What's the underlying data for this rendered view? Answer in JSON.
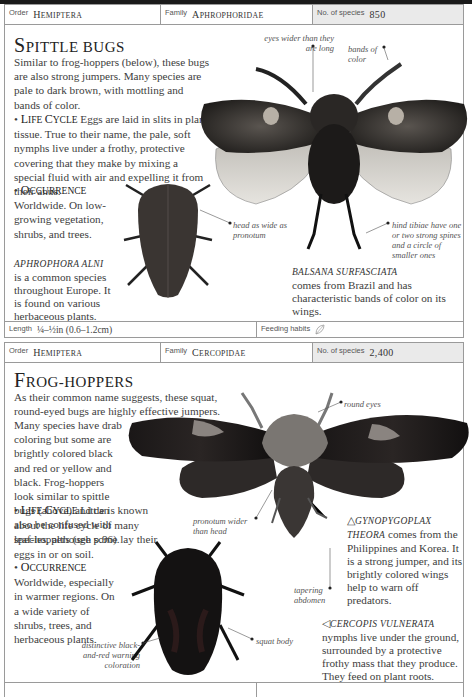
{
  "top": {
    "order_label": "Order",
    "order_value": "Hemiptera",
    "family_label": "Family",
    "family_value": "Aphrophoridae",
    "species_label": "No. of species",
    "species_value": "850"
  },
  "spittle": {
    "title_first": "S",
    "title_rest": "PITTLE BUGS",
    "intro": "Similar to frog-hoppers (below), these bugs are also strong jumpers. Many species are pale to dark brown, with mottling and bands of color.",
    "life_cycle_head_a": "L",
    "life_cycle_head_b": "IFE ",
    "life_cycle_head_c": "C",
    "life_cycle_head_d": "YCLE",
    "life_cycle_text": "Eggs are laid in slits in plant tissue. True to their name, the pale, soft nymphs live under a frothy, protective covering that they make by mixing a special fluid with air and expelling it from their anus.",
    "occurrence_head_a": "O",
    "occurrence_head_b": "CCURRENCE",
    "occurrence_text": "Worldwide. On low-growing vegetation, shrubs, and trees.",
    "species1_name": "APHROPHORA ALNI",
    "species1_text": "is a common species throughout Europe. It is found on various herbaceous plants.",
    "species2_name": "BALSANA SURFASCIATA",
    "species2_text": "comes from Brazil and has characteristic bands of color on its wings.",
    "annotations": {
      "eyes": "eyes wider than they are long",
      "bands": "bands of color",
      "head": "head as wide as pronotum",
      "tibiae": "hind tibiae have one or two strong spines and a circle of smaller ones"
    },
    "length_label": "Length",
    "length_value": "¼–½in (0.6–1.2cm)",
    "feeding_label": "Feeding habits",
    "feeding_icon": "leaf-icon"
  },
  "mid": {
    "order_label": "Order",
    "order_value": "Hemiptera",
    "family_label": "Family",
    "family_value": "Cercopidae",
    "species_label": "No. of species",
    "species_value": "2,400"
  },
  "frog": {
    "title_first": "F",
    "title_rest": "ROG-HOPPERS",
    "intro_wide": "As their common name suggests, these squat, round-eyed bugs are highly effective jumpers.",
    "intro_narrow": "Many species have drab coloring but some are brightly colored black and red or yellow and black. Frog-hoppers look similar to spittle bugs (above) and can also be confused with leaf-hoppers (see p.96).",
    "life_cycle_text": "Little is known about the life cycle of many species, although some lay their eggs in or on soil.",
    "occurrence_text": "Worldwide, especially in warmer regions. On a wide variety of shrubs, trees, and herbaceous plants.",
    "species1_marker": "△",
    "species1_name_a": "GYNOPYGOPLAX",
    "species1_name_b": "THEORA",
    "species1_text": "comes from the Philippines and Korea. It is a strong jumper, and its brightly colored wings help to warn off predators.",
    "species2_marker": "◁",
    "species2_name": "CERCOPIS VULNERATA",
    "species2_text": "nymphs live under the ground, surrounded by a protective frothy mass that they produce. They feed on plant roots.",
    "annotations": {
      "round_eyes": "round eyes",
      "pronotum": "pronotum wider than head",
      "abdomen": "tapering abdomen",
      "squat": "squat body",
      "warning": "distinctive black-and-red warning coloration"
    }
  }
}
